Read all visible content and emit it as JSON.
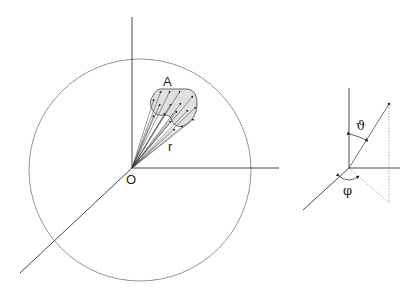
{
  "figure": {
    "left_panel": {
      "description": "Sphere centered at origin with a surface area A subtended by radius vectors r",
      "labels": {
        "area": "A",
        "radius": "r",
        "origin": "O"
      },
      "area_fill_color": "#e0e0e0"
    },
    "right_panel": {
      "description": "Spherical coordinate angles",
      "labels": {
        "polar_angle": "ϑ",
        "azimuth_angle": "φ"
      }
    },
    "line_color": "#333333"
  }
}
